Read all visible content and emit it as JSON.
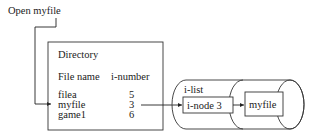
{
  "diagram": {
    "command_label": "Open myfile",
    "directory": {
      "title": "Directory",
      "headers": [
        "File name",
        "i-number"
      ],
      "rows": [
        {
          "name": "filea",
          "inumber": "5"
        },
        {
          "name": "myfile",
          "inumber": "3"
        },
        {
          "name": "game1",
          "inumber": "6"
        }
      ]
    },
    "ilist": {
      "label": "i-list",
      "inode_label": "i-node 3",
      "file_label": "myfile"
    }
  }
}
